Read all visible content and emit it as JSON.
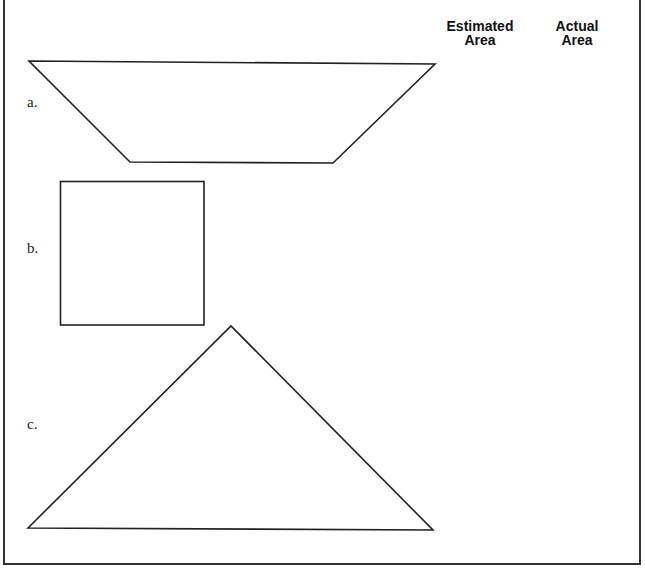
{
  "worksheet": {
    "columns": [
      {
        "line1": "Estimated",
        "line2": "Area"
      },
      {
        "line1": "Actual",
        "line2": "Area"
      }
    ],
    "problems": [
      {
        "label": "a.",
        "shape": "trapezoid",
        "estimated_area": "",
        "actual_area": ""
      },
      {
        "label": "b.",
        "shape": "square",
        "estimated_area": "",
        "actual_area": ""
      },
      {
        "label": "c.",
        "shape": "triangle",
        "estimated_area": "",
        "actual_area": ""
      }
    ]
  },
  "colors": {
    "stroke": "#222222",
    "background": "#ffffff"
  }
}
